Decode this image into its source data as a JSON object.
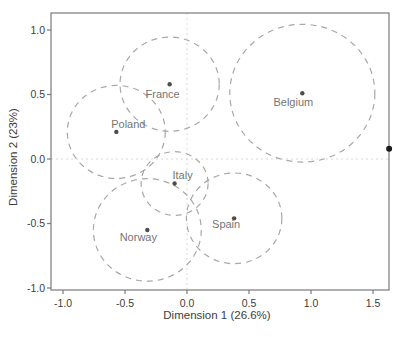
{
  "chart_data": {
    "type": "scatter",
    "title": "",
    "xlabel": "Dimension 1 (26.6%)",
    "ylabel": "Dimension 2 (23%)",
    "xlim": [
      -1.1,
      1.63
    ],
    "ylim": [
      -1.02,
      1.13
    ],
    "x_ticks": [
      -1.0,
      -0.5,
      0.0,
      0.5,
      1.0,
      1.5
    ],
    "y_ticks": [
      -1.0,
      -0.5,
      0.0,
      0.5,
      1.0
    ],
    "grid": "dashed reference lines at x=0 and y=0",
    "legend": "none",
    "points": [
      {
        "label": "France",
        "x": -0.14,
        "y": 0.58,
        "circle_radius": 0.4,
        "label_dx": -7,
        "label_dy": 10
      },
      {
        "label": "Belgium",
        "x": 0.93,
        "y": 0.51,
        "circle_radius": 0.585,
        "label_dx": -9,
        "label_dy": 9
      },
      {
        "label": "Poland",
        "x": -0.57,
        "y": 0.21,
        "circle_radius": 0.395,
        "label_dx": 12,
        "label_dy": -7
      },
      {
        "label": "Italy",
        "x": -0.1,
        "y": -0.19,
        "circle_radius": 0.27,
        "label_dx": 8,
        "label_dy": -8
      },
      {
        "label": "Norway",
        "x": -0.32,
        "y": -0.55,
        "circle_radius": 0.435,
        "label_dx": -9,
        "label_dy": 8
      },
      {
        "label": "Spain",
        "x": 0.38,
        "y": -0.46,
        "circle_radius": 0.385,
        "label_dx": -8,
        "label_dy": 6
      }
    ],
    "edge_point": {
      "x": 1.63,
      "y": 0.08,
      "note": "black point clipped at right plot border"
    },
    "colors": {
      "background": "#ffffff",
      "frame": "#7a7a7a",
      "grid": "#d9d9d9",
      "circle": "#a8a8a8",
      "point": "#4d4d4d",
      "point_label": "#757575",
      "tick_label": "#3d3d3d",
      "axis_title": "#3d3d3d",
      "edge_point": "#1a1a1a"
    }
  }
}
